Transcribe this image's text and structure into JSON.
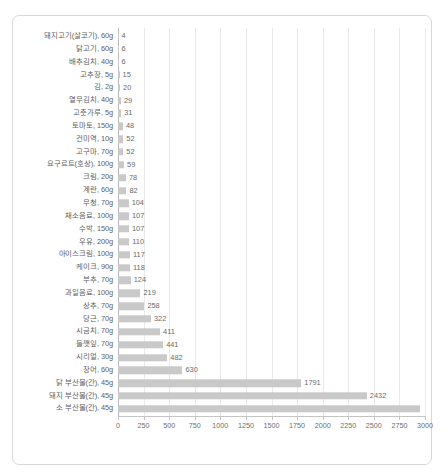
{
  "chart_data": {
    "type": "bar",
    "orientation": "horizontal",
    "title": "",
    "subtitle": "",
    "xlabel": "",
    "ylabel": "",
    "xlim": [
      0,
      3000
    ],
    "grid": true,
    "legend": null,
    "bar_color": "#c9c9c9",
    "xticks": [
      0,
      250,
      500,
      750,
      1000,
      1250,
      1500,
      1750,
      2000,
      2250,
      2500,
      2750,
      3000
    ],
    "xtick_labels": [
      "0",
      "250",
      "500",
      "750",
      "1000",
      "1250",
      "1500",
      "1750",
      "2000",
      "2250",
      "2500",
      "2750",
      "3000"
    ],
    "categories": [
      "돼지고기(살코기), 60g",
      "닭고기, 60g",
      "배추김치, 40g",
      "고추장, 5g",
      "김, 2g",
      "열무김치, 40g",
      "고춧가루, 5g",
      "토마토, 150g",
      "건미역, 10g",
      "고구마, 70g",
      "요구르트(호상), 100g",
      "크림, 20g",
      "계란, 60g",
      "무청, 70g",
      "채소음료, 100g",
      "수박, 150g",
      "우유, 200g",
      "아이스크림, 100g",
      "케이크, 90g",
      "부추, 70g",
      "과일음료, 100g",
      "상추, 70g",
      "당근, 70g",
      "시금치, 70g",
      "들깻잎, 70g",
      "시리얼, 30g",
      "장어, 60g",
      "닭 부산물(간), 45g",
      "돼지 부산물(간), 45g",
      "소 부산물(간), 45g"
    ],
    "values": [
      4,
      6,
      6,
      15,
      20,
      29,
      31,
      48,
      52,
      52,
      59,
      78,
      82,
      104,
      107,
      107,
      110,
      117,
      118,
      124,
      219,
      258,
      322,
      411,
      441,
      482,
      630,
      1791,
      2432,
      2950
    ],
    "value_labels": [
      "4",
      "6",
      "6",
      "15",
      "20",
      "29",
      "31",
      "48",
      "52",
      "52",
      "59",
      "78",
      "82",
      "104",
      "107",
      "107",
      "110",
      "117",
      "118",
      "124",
      "219",
      "258",
      "322",
      "411",
      "441",
      "482",
      "630",
      "1791",
      "2432",
      ""
    ]
  }
}
